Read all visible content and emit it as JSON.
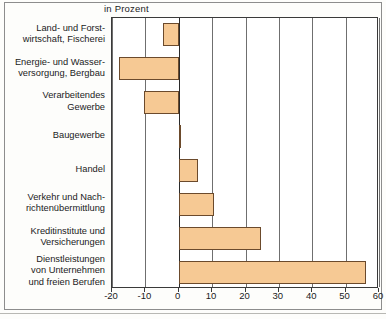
{
  "chart_data": {
    "type": "bar",
    "orientation": "horizontal",
    "title": "in Prozent",
    "xlabel": "",
    "ylabel": "",
    "xlim": [
      -20,
      60
    ],
    "xticks": [
      -20,
      -10,
      0,
      10,
      20,
      30,
      40,
      50,
      60
    ],
    "xtick_labels": [
      "-20",
      "-10",
      "0",
      "10",
      "20",
      "30",
      "40",
      "50",
      "60"
    ],
    "grid": true,
    "legend": "none",
    "categories": [
      "Land- und Forst-\nwirtschaft, Fischerei",
      "Energie- und Wasser-\nversorgung, Bergbau",
      "Verarbeitendes\nGewerbe",
      "Baugewerbe",
      "Handel",
      "Verkehr und Nach-\nrichtenübermittlung",
      "Kreditinstitute und\nVersicherungen",
      "Dienstleistungen\nvon Unternehmen\nund freien Berufen"
    ],
    "values": [
      -4.7,
      -17.8,
      -10.5,
      0.5,
      5.8,
      10.5,
      24.5,
      56.0
    ],
    "bar_color": "#f6c994",
    "bar_border_color": "#6b4a2c",
    "axis_color": "#3a3a3a",
    "grid_color": "#6f6f6f"
  }
}
